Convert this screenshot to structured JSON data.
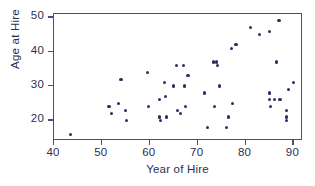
{
  "chart_data": {
    "type": "scatter",
    "title": "",
    "xlabel": "Year of Hire",
    "ylabel": "Age at Hire",
    "xlim": [
      40,
      92
    ],
    "ylim": [
      14,
      51
    ],
    "xticks": [
      40,
      50,
      60,
      70,
      80,
      90
    ],
    "yticks": [
      20,
      30,
      40,
      50
    ],
    "grid": false,
    "legend": null,
    "marker": {
      "shape": "circle",
      "color": "#2b2f66",
      "size": 3.2
    },
    "frame_color": "#4a4f75",
    "points": [
      {
        "x": 43.5,
        "y": 16
      },
      {
        "x": 51.5,
        "y": 24
      },
      {
        "x": 52.0,
        "y": 22
      },
      {
        "x": 53.5,
        "y": 25
      },
      {
        "x": 54.0,
        "y": 32
      },
      {
        "x": 55.0,
        "y": 23
      },
      {
        "x": 55.2,
        "y": 20
      },
      {
        "x": 59.5,
        "y": 34
      },
      {
        "x": 59.8,
        "y": 24
      },
      {
        "x": 62.0,
        "y": 26
      },
      {
        "x": 62.0,
        "y": 21
      },
      {
        "x": 62.2,
        "y": 20
      },
      {
        "x": 63.0,
        "y": 31
      },
      {
        "x": 63.3,
        "y": 27
      },
      {
        "x": 63.5,
        "y": 21
      },
      {
        "x": 65.0,
        "y": 30
      },
      {
        "x": 65.5,
        "y": 36
      },
      {
        "x": 65.8,
        "y": 23
      },
      {
        "x": 66.5,
        "y": 22
      },
      {
        "x": 67.0,
        "y": 36
      },
      {
        "x": 67.2,
        "y": 30
      },
      {
        "x": 67.5,
        "y": 24
      },
      {
        "x": 68.0,
        "y": 33
      },
      {
        "x": 71.5,
        "y": 28
      },
      {
        "x": 72.0,
        "y": 18
      },
      {
        "x": 73.3,
        "y": 37
      },
      {
        "x": 73.5,
        "y": 24
      },
      {
        "x": 74.0,
        "y": 37
      },
      {
        "x": 74.2,
        "y": 36
      },
      {
        "x": 74.5,
        "y": 30
      },
      {
        "x": 76.0,
        "y": 18
      },
      {
        "x": 76.5,
        "y": 21
      },
      {
        "x": 77.0,
        "y": 41
      },
      {
        "x": 77.2,
        "y": 25
      },
      {
        "x": 78.0,
        "y": 42
      },
      {
        "x": 81.0,
        "y": 47
      },
      {
        "x": 83.0,
        "y": 45
      },
      {
        "x": 85.0,
        "y": 46
      },
      {
        "x": 85.0,
        "y": 28
      },
      {
        "x": 85.0,
        "y": 26
      },
      {
        "x": 85.2,
        "y": 24
      },
      {
        "x": 86.0,
        "y": 26
      },
      {
        "x": 86.5,
        "y": 37
      },
      {
        "x": 87.0,
        "y": 49
      },
      {
        "x": 87.2,
        "y": 26
      },
      {
        "x": 88.5,
        "y": 23
      },
      {
        "x": 88.5,
        "y": 21
      },
      {
        "x": 88.5,
        "y": 20
      },
      {
        "x": 89.0,
        "y": 29
      },
      {
        "x": 90.0,
        "y": 31
      }
    ]
  }
}
